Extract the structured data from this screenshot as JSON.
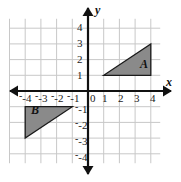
{
  "figure": {
    "kind": "coordinate-plane-diagram",
    "background_color": "#ffffff",
    "grid_color": "#c8c8c8",
    "axis_color": "#111111",
    "shape_fill": "#8a8a8a",
    "shape_stroke": "#1a1a1a"
  },
  "axes": {
    "x_axis_label": "x",
    "y_axis_label": "y",
    "origin_label": "0",
    "x_min": -5,
    "x_max": 4.6,
    "y_min": -4.6,
    "y_max": 4.6,
    "x_ticks": [
      "-4",
      "-3",
      "-2",
      "-1",
      "1",
      "2",
      "3",
      "4"
    ],
    "y_ticks": [
      "4",
      "3",
      "2",
      "1",
      "-1",
      "-2",
      "-3",
      "-4"
    ],
    "x_tick_values": [
      -4,
      -3,
      -2,
      -1,
      1,
      2,
      3,
      4
    ],
    "y_tick_values": [
      4,
      3,
      2,
      1,
      -1,
      -2,
      -3,
      -4
    ]
  },
  "shapes": [
    {
      "label": "A",
      "type": "triangle",
      "vertices": [
        [
          1,
          1
        ],
        [
          4,
          1
        ],
        [
          4,
          3
        ]
      ],
      "label_position": [
        3.3,
        1.6
      ],
      "fill": "#8a8a8a"
    },
    {
      "label": "B",
      "type": "triangle",
      "vertices": [
        [
          -4,
          -1
        ],
        [
          -1,
          -1
        ],
        [
          -4,
          -3
        ]
      ],
      "label_position": [
        -3.6,
        -1.55
      ],
      "fill": "#8a8a8a"
    }
  ]
}
